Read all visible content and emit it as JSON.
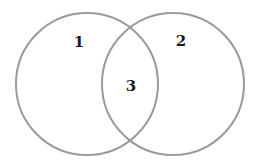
{
  "diagram": {
    "type": "venn",
    "stroke_color": "#9a9a9a",
    "label_color": "#1a1a1a",
    "background": "#ffffff",
    "circles": [
      {
        "name": "left-circle",
        "cx": 87,
        "cy": 84,
        "r": 71
      },
      {
        "name": "right-circle",
        "cx": 173,
        "cy": 84,
        "r": 71
      }
    ],
    "regions": [
      {
        "name": "region-1",
        "label": "1",
        "x": 79,
        "y": 42
      },
      {
        "name": "region-2",
        "label": "2",
        "x": 181,
        "y": 41
      },
      {
        "name": "region-3",
        "label": "3",
        "x": 131,
        "y": 86
      }
    ]
  }
}
